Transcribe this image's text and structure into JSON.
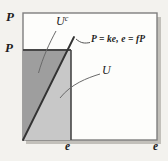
{
  "figure": {
    "axes": {
      "y_label": "P",
      "x_label": "e"
    },
    "ticks": {
      "price_level": "P",
      "exchange_rate": "e"
    },
    "equation_label": "P = ke, e = fP",
    "regions": {
      "complement": {
        "base": "U",
        "sup": "c"
      },
      "main": {
        "base": "U"
      }
    },
    "colors": {
      "dark_region": "#9e9e9e",
      "light_region": "#c8c8c8",
      "line": "#333333",
      "box_border": "#7e7e7e",
      "background": "#f3f2ee",
      "plot_bg": "#fdfdfb",
      "shadow": "#c2c0ba"
    }
  }
}
